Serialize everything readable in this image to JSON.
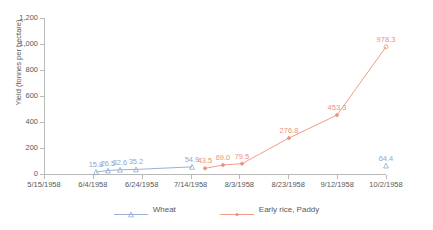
{
  "chart_data": {
    "type": "line",
    "title": "",
    "xlabel": "",
    "ylabel": "Yield (tonnes per hectare)",
    "ylim": [
      0,
      1200
    ],
    "ytick_labels": [
      "0",
      "200",
      "400",
      "600",
      "800",
      "1,000",
      "1,200"
    ],
    "ytick_values": [
      0,
      200,
      400,
      600,
      800,
      1000,
      1200
    ],
    "xtick_labels": [
      "5/15/1958",
      "6/4/1958",
      "6/24/1958",
      "7/14/1958",
      "8/3/1958",
      "8/23/1958",
      "9/12/1958",
      "10/2/1958"
    ],
    "xlim": [
      "5/15/1958",
      "10/2/1958"
    ],
    "grid": false,
    "legend_position": "bottom",
    "series": [
      {
        "name": "Wheat",
        "color": "#8fa8cf",
        "marker": "triangle",
        "points": [
          {
            "x": "6/8/1958",
            "x_pos": 96,
            "y": 15.8,
            "label": "15.8"
          },
          {
            "x": "6/13/1958",
            "x_pos": 108,
            "y": 26.5,
            "label": "26.5"
          },
          {
            "x": "6/18/1958",
            "x_pos": 120,
            "y": 32.6,
            "label": "32.6"
          },
          {
            "x": "6/24/1958",
            "x_pos": 136,
            "y": 35.2,
            "label": "35.2"
          },
          {
            "x": "7/14/1958",
            "x_pos": 192,
            "y": 54.9,
            "label": "54.9"
          },
          {
            "x": "9/27/1958",
            "x_pos": 386,
            "y": 64.4,
            "label": "64.4"
          }
        ]
      },
      {
        "name": "Early rice, Paddy",
        "color": "#f0907a",
        "marker": "dot",
        "points": [
          {
            "x": "7/19/1958",
            "x_pos": 205,
            "y": 43.5,
            "label": "43.5"
          },
          {
            "x": "7/26/1958",
            "x_pos": 223,
            "y": 69.0,
            "label": "69.0"
          },
          {
            "x": "8/3/1958",
            "x_pos": 242,
            "y": 79.5,
            "label": "79.5"
          },
          {
            "x": "8/13/1958",
            "x_pos": 289,
            "y": 276.8,
            "label": "276.8"
          },
          {
            "x": "9/7/1958",
            "x_pos": 337,
            "y": 453.3,
            "label": "453.3"
          },
          {
            "x": "9/27/1958",
            "x_pos": 386,
            "y": 978.3,
            "label": "978.3"
          }
        ]
      }
    ]
  },
  "legend": {
    "items": [
      {
        "label": "Wheat",
        "color": "#8fa8cf"
      },
      {
        "label": "Early rice, Paddy",
        "color": "#f0907a"
      }
    ]
  },
  "axes": {
    "y_title": "Yield (tonnes per hectare)"
  }
}
